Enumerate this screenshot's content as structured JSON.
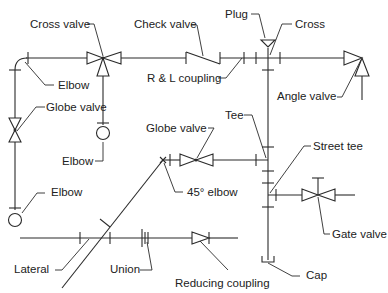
{
  "diagram": {
    "line_color": "#2a2a2a",
    "text_color": "#222222",
    "labels": {
      "cross_valve": "Cross valve",
      "check_valve": "Check valve",
      "plug": "Plug",
      "cross": "Cross",
      "elbow_top": "Elbow",
      "rl_coupling": "R & L coupling",
      "angle_valve": "Angle valve",
      "globe_valve_left": "Globe valve",
      "elbow_mid": "Elbow",
      "tee": "Tee",
      "globe_valve_mid": "Globe valve",
      "street_tee": "Street tee",
      "elbow_bottom": "Elbow",
      "elbow_45": "45° elbow",
      "gate_valve": "Gate valve",
      "lateral": "Lateral",
      "union": "Union",
      "reducing_coupling": "Reducing coupling",
      "cap": "Cap"
    }
  }
}
